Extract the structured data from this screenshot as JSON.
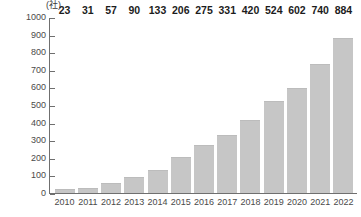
{
  "chart_data": {
    "type": "bar",
    "title": "",
    "subtitle": "",
    "xlabel": "",
    "ylabel": "",
    "unit_label": "(社)",
    "categories": [
      "2010",
      "2011",
      "2012",
      "2013",
      "2014",
      "2015",
      "2016",
      "2017",
      "2018",
      "2019",
      "2020",
      "2021",
      "2022"
    ],
    "values": [
      23,
      31,
      57,
      90,
      133,
      206,
      275,
      331,
      420,
      524,
      602,
      740,
      884
    ],
    "data_labels": [
      "23",
      "31",
      "57",
      "90",
      "133",
      "206",
      "275",
      "331",
      "420",
      "524",
      "602",
      "740",
      "884"
    ],
    "ylim": [
      0,
      1000
    ],
    "y_tick_step": 100,
    "y_ticks": [
      1000,
      900,
      800,
      700,
      600,
      500,
      400,
      300,
      200,
      100,
      0
    ],
    "y_tick_labels": [
      "1000",
      "900",
      "800",
      "700",
      "600",
      "500",
      "400",
      "300",
      "200",
      "100",
      "0"
    ],
    "grid": false,
    "legend": null,
    "legend_position": "none",
    "series": [
      {
        "name": "",
        "values": [
          23,
          31,
          57,
          90,
          133,
          206,
          275,
          331,
          420,
          524,
          602,
          740,
          884
        ]
      }
    ],
    "colors": {
      "bar_fill": "#c6c6c6",
      "axis": "#6f6f6f",
      "tick_text": "#4a4a4a",
      "data_label_text": "#1c1c1c",
      "background": "#ffffff"
    }
  }
}
